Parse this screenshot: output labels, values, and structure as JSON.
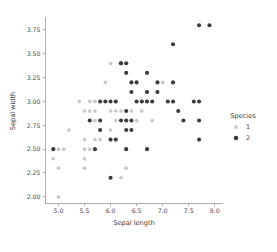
{
  "chart_data": {
    "type": "scatter",
    "title": "",
    "xlabel": "Sepal length",
    "ylabel": "Sepal width",
    "xlim": [
      4.75,
      8.15
    ],
    "ylim": [
      1.93,
      3.87
    ],
    "xticks": [
      "5.0",
      "5.5",
      "6.0",
      "6.5",
      "7.0",
      "7.5",
      "8.0"
    ],
    "xtick_values": [
      5.0,
      5.5,
      6.0,
      6.5,
      7.0,
      7.5,
      8.0
    ],
    "yticks": [
      "2.00",
      "2.25",
      "2.50",
      "2.75",
      "3.00",
      "3.25",
      "3.50",
      "3.75"
    ],
    "ytick_values": [
      2.0,
      2.25,
      2.5,
      2.75,
      3.0,
      3.25,
      3.5,
      3.75
    ],
    "grid": false,
    "legend": {
      "title": "Species",
      "position": "right",
      "entries": [
        {
          "label": "1",
          "color": "#c9c9c9"
        },
        {
          "label": "2",
          "color": "#3b3b3b"
        }
      ]
    },
    "series": [
      {
        "name": "1",
        "color": "#c9c9c9",
        "marker": "circle",
        "points": [
          [
            4.9,
            2.4
          ],
          [
            5.0,
            2.0
          ],
          [
            5.0,
            2.3
          ],
          [
            5.0,
            2.5
          ],
          [
            5.1,
            2.5
          ],
          [
            5.2,
            2.7
          ],
          [
            5.4,
            3.0
          ],
          [
            5.5,
            2.3
          ],
          [
            5.5,
            2.4
          ],
          [
            5.5,
            2.5
          ],
          [
            5.5,
            2.6
          ],
          [
            5.5,
            2.9
          ],
          [
            5.6,
            2.5
          ],
          [
            5.6,
            2.9
          ],
          [
            5.6,
            3.0
          ],
          [
            5.7,
            2.6
          ],
          [
            5.7,
            2.8
          ],
          [
            5.7,
            2.9
          ],
          [
            5.7,
            3.0
          ],
          [
            5.8,
            2.6
          ],
          [
            5.8,
            2.7
          ],
          [
            5.9,
            3.0
          ],
          [
            5.9,
            3.2
          ],
          [
            6.0,
            2.2
          ],
          [
            6.0,
            2.7
          ],
          [
            6.0,
            2.9
          ],
          [
            6.0,
            3.4
          ],
          [
            6.1,
            2.8
          ],
          [
            6.1,
            2.9
          ],
          [
            6.1,
            3.0
          ],
          [
            6.2,
            2.2
          ],
          [
            6.2,
            2.9
          ],
          [
            6.3,
            2.3
          ],
          [
            6.3,
            2.5
          ],
          [
            6.4,
            2.9
          ],
          [
            6.5,
            2.8
          ],
          [
            6.6,
            2.9
          ],
          [
            6.6,
            3.0
          ],
          [
            6.7,
            3.0
          ],
          [
            6.7,
            3.1
          ],
          [
            6.8,
            2.8
          ],
          [
            6.9,
            3.1
          ],
          [
            7.0,
            3.2
          ]
        ]
      },
      {
        "name": "2",
        "color": "#3b3b3b",
        "marker": "circle",
        "points": [
          [
            4.9,
            2.5
          ],
          [
            5.6,
            2.8
          ],
          [
            5.7,
            2.5
          ],
          [
            5.8,
            2.7
          ],
          [
            5.8,
            2.8
          ],
          [
            5.8,
            3.0
          ],
          [
            5.9,
            3.0
          ],
          [
            6.0,
            2.2
          ],
          [
            6.0,
            3.0
          ],
          [
            6.0,
            2.6
          ],
          [
            6.1,
            2.6
          ],
          [
            6.1,
            3.0
          ],
          [
            6.2,
            2.8
          ],
          [
            6.2,
            3.4
          ],
          [
            6.2,
            3.4
          ],
          [
            6.3,
            2.5
          ],
          [
            6.3,
            2.7
          ],
          [
            6.3,
            2.8
          ],
          [
            6.3,
            2.9
          ],
          [
            6.3,
            3.3
          ],
          [
            6.3,
            3.4
          ],
          [
            6.4,
            2.7
          ],
          [
            6.4,
            2.8
          ],
          [
            6.4,
            3.1
          ],
          [
            6.4,
            3.2
          ],
          [
            6.5,
            3.0
          ],
          [
            6.5,
            3.2
          ],
          [
            6.6,
            3.0
          ],
          [
            6.7,
            2.5
          ],
          [
            6.7,
            3.0
          ],
          [
            6.7,
            3.1
          ],
          [
            6.7,
            3.3
          ],
          [
            6.8,
            3.0
          ],
          [
            6.9,
            3.1
          ],
          [
            6.9,
            3.2
          ],
          [
            7.1,
            3.0
          ],
          [
            7.2,
            3.0
          ],
          [
            7.2,
            3.2
          ],
          [
            7.2,
            3.6
          ],
          [
            7.3,
            2.9
          ],
          [
            7.4,
            2.8
          ],
          [
            7.6,
            3.0
          ],
          [
            7.7,
            2.6
          ],
          [
            7.7,
            2.8
          ],
          [
            7.7,
            3.0
          ],
          [
            7.7,
            3.8
          ],
          [
            7.9,
            3.8
          ]
        ]
      }
    ]
  }
}
